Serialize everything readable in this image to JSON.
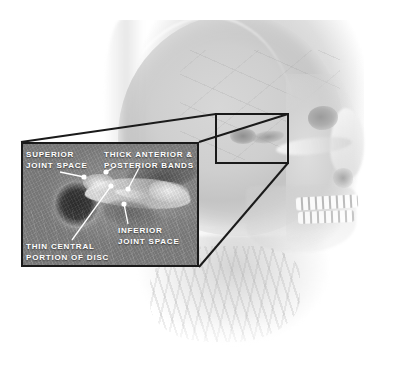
{
  "figure": {
    "style": "grayscale medical illustration"
  },
  "colors": {
    "background": "#ffffff",
    "label_text": "#ffffff",
    "callout_border": "#1a1a1a",
    "inset_fill": "#8e8e8e",
    "anatomy_mid": "#d2d2d2",
    "condyle_dark": "#3c3c3c",
    "disc_bright": "#f6f6f6"
  },
  "callout": {
    "source_rect": {
      "x": 216,
      "y": 114,
      "width": 72,
      "height": 49
    },
    "inset_rect": {
      "x": 21,
      "y": 142,
      "width": 178,
      "height": 125
    },
    "border_width_px": 2,
    "magnification_style": "3d-perspective-projection"
  },
  "annotations": [
    {
      "id": "superior-joint-space",
      "label": "SUPERIOR\nJOINT SPACE",
      "text_x": 26,
      "text_y": 150,
      "dots": [
        {
          "x": 84,
          "y": 177
        }
      ]
    },
    {
      "id": "thick-anterior-posterior-bands",
      "label": "THICK ANTERIOR &\nPOSTERIOR BANDS",
      "text_x": 104,
      "text_y": 150,
      "dots": [
        {
          "x": 106,
          "y": 172
        },
        {
          "x": 128,
          "y": 189
        }
      ]
    },
    {
      "id": "inferior-joint-space",
      "label": "INFERIOR\nJOINT SPACE",
      "text_x": 118,
      "text_y": 226,
      "dots": [
        {
          "x": 124,
          "y": 204
        }
      ]
    },
    {
      "id": "thin-central-portion-of-disc",
      "label": "THIN CENTRAL\nPORTION OF DISC",
      "text_x": 26,
      "text_y": 242,
      "dots": [
        {
          "x": 111,
          "y": 186
        }
      ]
    }
  ],
  "anatomy_parts": [
    {
      "name": "skull-dome",
      "label": "cranial vault"
    },
    {
      "name": "eye-socket",
      "label": "orbit"
    },
    {
      "name": "nasal-aperture",
      "label": "nasal aperture"
    },
    {
      "name": "teeth-upper",
      "label": "maxillary teeth"
    },
    {
      "name": "teeth-lower",
      "label": "mandibular teeth"
    },
    {
      "name": "mandible",
      "label": "mandible"
    },
    {
      "name": "neck",
      "label": "cervical soft tissue"
    },
    {
      "name": "condyle",
      "label": "mandibular condyle"
    },
    {
      "name": "articular-disc",
      "label": "articular disc"
    }
  ]
}
